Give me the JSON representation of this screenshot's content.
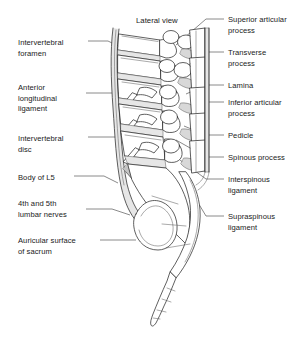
{
  "figure": {
    "title": "Lateral view"
  },
  "labels_left": [
    {
      "id": "intervertebral-foramen",
      "text": "Intervertebral\nforamen",
      "x": 18,
      "y": 38
    },
    {
      "id": "anterior-longitudinal-ligament",
      "text": "Anterior\nlongitudinal\nligament",
      "x": 18,
      "y": 83
    },
    {
      "id": "intervertebral-disc",
      "text": "Intervertebral\ndisc",
      "x": 18,
      "y": 134
    },
    {
      "id": "body-of-l5",
      "text": "Body of L5",
      "x": 18,
      "y": 173
    },
    {
      "id": "lumbar-nerves",
      "text": "4th and 5th\nlumbar nerves",
      "x": 18,
      "y": 199
    },
    {
      "id": "auricular-surface-of-sacrum",
      "text": "Auricular surface\nof sacrum",
      "x": 18,
      "y": 236
    }
  ],
  "labels_right": [
    {
      "id": "superior-articular-process",
      "text": "Superior articular\nprocess",
      "x": 228,
      "y": 15
    },
    {
      "id": "transverse-process",
      "text": "Transverse\nprocess",
      "x": 228,
      "y": 48
    },
    {
      "id": "lamina",
      "text": "Lamina",
      "x": 228,
      "y": 81
    },
    {
      "id": "inferior-articular-process",
      "text": "Inferior articular\nprocess",
      "x": 228,
      "y": 98
    },
    {
      "id": "pedicle",
      "text": "Pedicle",
      "x": 228,
      "y": 131
    },
    {
      "id": "spinous-process",
      "text": "Spinous process",
      "x": 228,
      "y": 153
    },
    {
      "id": "interspinous-ligament",
      "text": "Interspinous\nligament",
      "x": 228,
      "y": 175
    },
    {
      "id": "supraspinous-ligament",
      "text": "Supraspinous\nligament",
      "x": 228,
      "y": 212
    }
  ],
  "colors": {
    "background": "#ffffff",
    "ink": "#2b2b2b",
    "leader": "#4a4a4a",
    "text": "#1a1a1a",
    "shading": "#d8d8d8"
  }
}
